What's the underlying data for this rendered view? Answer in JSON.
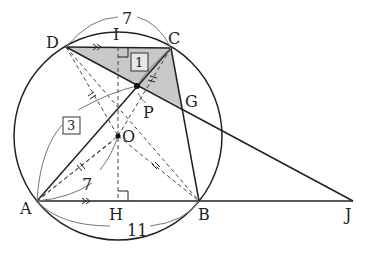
{
  "diagram": {
    "type": "geometry",
    "points": {
      "A": {
        "label": "A",
        "x": 37,
        "y": 201
      },
      "B": {
        "label": "B",
        "x": 199,
        "y": 201
      },
      "C": {
        "label": "C",
        "x": 171,
        "y": 48
      },
      "D": {
        "label": "D",
        "x": 66,
        "y": 47
      },
      "I": {
        "label": "I",
        "x": 118,
        "y": 47
      },
      "H": {
        "label": "H",
        "x": 118,
        "y": 201
      },
      "O": {
        "label": "O",
        "x": 118,
        "y": 136
      },
      "P": {
        "label": "P",
        "x": 137,
        "y": 86
      },
      "G": {
        "label": "G",
        "x": 183,
        "y": 108
      },
      "J": {
        "label": "J",
        "x": 353,
        "y": 201
      }
    },
    "circle": {
      "center": "O",
      "cx": 118,
      "cy": 136,
      "r": 104
    },
    "measurements": {
      "DC": "7",
      "AB": "11",
      "AO": "7",
      "AP_box": "3",
      "PC_box": "1"
    },
    "markings": {
      "parallel": [
        "DC",
        "AB"
      ],
      "right_angles": [
        "I",
        "H"
      ],
      "equal_ticks": [
        "DO",
        "AO",
        "BO",
        "CO"
      ]
    },
    "shaded_region": [
      "D",
      "C",
      "G",
      "P"
    ],
    "colors": {
      "line": "#222222",
      "shade": "#c8c8c8",
      "thin": "#777777"
    }
  }
}
